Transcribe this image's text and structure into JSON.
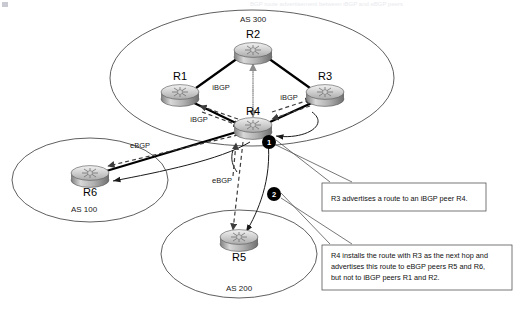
{
  "diagram": {
    "title": "BGP route advertisement between iBGP and eBGP peers",
    "background_color": "#ffffff",
    "line_color": "#000000",
    "badge_color": "#000000"
  },
  "autonomous_systems": [
    {
      "id": "as300",
      "label": "AS 300",
      "routers": [
        "R1",
        "R2",
        "R3",
        "R4"
      ]
    },
    {
      "id": "as100",
      "label": "AS 100",
      "routers": [
        "R6"
      ]
    },
    {
      "id": "as200",
      "label": "AS 200",
      "routers": [
        "R5"
      ]
    }
  ],
  "routers": [
    {
      "id": "r1",
      "label": "R1",
      "as": "AS 300"
    },
    {
      "id": "r2",
      "label": "R2",
      "as": "AS 300"
    },
    {
      "id": "r3",
      "label": "R3",
      "as": "AS 300"
    },
    {
      "id": "r4",
      "label": "R4",
      "as": "AS 300"
    },
    {
      "id": "r5",
      "label": "R5",
      "as": "AS 200"
    },
    {
      "id": "r6",
      "label": "R6",
      "as": "AS 100"
    }
  ],
  "edge_labels": {
    "ibgp_r1_r2": "iBGP",
    "ibgp_r3_r4": "iBGP",
    "ibgp_r1_r4": "iBGP",
    "ebgp_r4_r6": "eBGP",
    "ebgp_r4_r5": "eBGP"
  },
  "badges": [
    {
      "id": "badge1",
      "number": "1"
    },
    {
      "id": "badge2",
      "number": "2"
    }
  ],
  "callouts": [
    {
      "id": "callout1",
      "lines": [
        "R3 advertises a route to an iBGP peer R4."
      ]
    },
    {
      "id": "callout2",
      "lines": [
        "R4 installs the route with R3 as the next hop and",
        "advertises this route to eBGP peers R5 and R6,",
        "but not to iBGP peers R1 and R2."
      ]
    }
  ]
}
